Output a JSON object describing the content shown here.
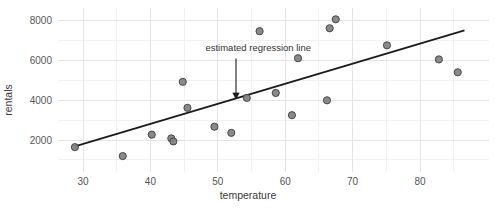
{
  "chart_data": {
    "type": "scatter",
    "title": "",
    "xlabel": "temperature",
    "ylabel": "rentals",
    "xlim": [
      26,
      89
    ],
    "ylim": [
      800,
      8600
    ],
    "grid": true,
    "legend": "none",
    "x_ticks": [
      "30",
      "40",
      "50",
      "60",
      "70",
      "80"
    ],
    "x_tick_values": [
      30,
      40,
      50,
      60,
      70,
      80
    ],
    "y_ticks": [
      "2000",
      "4000",
      "6000",
      "8000"
    ],
    "y_tick_values": [
      2000,
      4000,
      6000,
      8000
    ],
    "points": [
      {
        "x": 28.8,
        "y": 1640
      },
      {
        "x": 35.9,
        "y": 1190
      },
      {
        "x": 40.2,
        "y": 2270
      },
      {
        "x": 43.1,
        "y": 2080
      },
      {
        "x": 43.4,
        "y": 1930
      },
      {
        "x": 44.8,
        "y": 4930
      },
      {
        "x": 45.5,
        "y": 3620
      },
      {
        "x": 49.5,
        "y": 2670
      },
      {
        "x": 52.0,
        "y": 2360
      },
      {
        "x": 54.3,
        "y": 4120
      },
      {
        "x": 56.2,
        "y": 7480
      },
      {
        "x": 58.6,
        "y": 4370
      },
      {
        "x": 61.0,
        "y": 3250
      },
      {
        "x": 61.9,
        "y": 6120
      },
      {
        "x": 66.2,
        "y": 4000
      },
      {
        "x": 66.6,
        "y": 7630
      },
      {
        "x": 67.5,
        "y": 8080
      },
      {
        "x": 75.1,
        "y": 6770
      },
      {
        "x": 82.8,
        "y": 6060
      },
      {
        "x": 85.6,
        "y": 5410
      }
    ],
    "regression_line": {
      "x_start": 28.8,
      "y_start": 1680,
      "x_end": 86.6,
      "y_end": 7520
    },
    "annotations": [
      {
        "text": "estimated regression line",
        "text_x": 56.0,
        "text_y": 6500,
        "arrow_from_x": 52.7,
        "arrow_from_y": 6100,
        "arrow_to_x": 52.7,
        "arrow_to_y": 4070
      }
    ],
    "colors": {
      "point_fill": "#808080",
      "point_stroke": "#3d3d3d",
      "line": "#1a1a1a",
      "grid_major": "#e4e4e4",
      "grid_minor": "#f1f1f1",
      "background": "#ffffff",
      "tick_label": "#555555",
      "axis_title": "#3a3a3a"
    }
  }
}
